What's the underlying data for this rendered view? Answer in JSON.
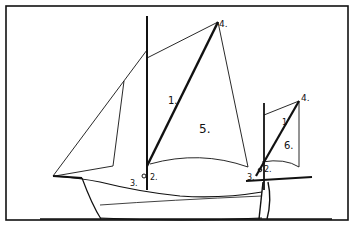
{
  "diagram": {
    "colors": {
      "ink": "#111111",
      "background": "#ffffff"
    },
    "labels": {
      "main_luff": "1.",
      "main_tack_2": "2.",
      "main_tack_3": "3.",
      "main_peak": "4.",
      "main_sail": "5.",
      "mizzen_luff": "1",
      "mizzen_tack_2": "2.",
      "mizzen_tack_3": "3.",
      "mizzen_peak": "4.",
      "mizzen_sail": "6."
    }
  }
}
